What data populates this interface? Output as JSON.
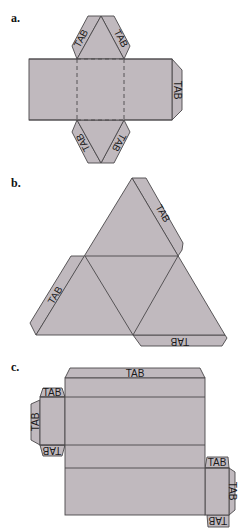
{
  "figure": {
    "parts": [
      {
        "label": "a.",
        "shape": "triangular-prism net with dashed fold square",
        "tabs": [
          "TAB",
          "TAB",
          "TAB",
          "TAB",
          "TAB"
        ]
      },
      {
        "label": "b.",
        "shape": "tetrahedron net (four triangles)",
        "tabs": [
          "TAB",
          "TAB",
          "TAB"
        ]
      },
      {
        "label": "c.",
        "shape": "rectangular box net",
        "tabs": [
          "TAB",
          "TAB",
          "TAB",
          "TAB",
          "TAB",
          "TAB",
          "TAB"
        ]
      }
    ],
    "tab_text": "TAB",
    "colors": {
      "fill": "#c0b9be",
      "stroke": "#4a474a",
      "background": "#ffffff"
    }
  }
}
